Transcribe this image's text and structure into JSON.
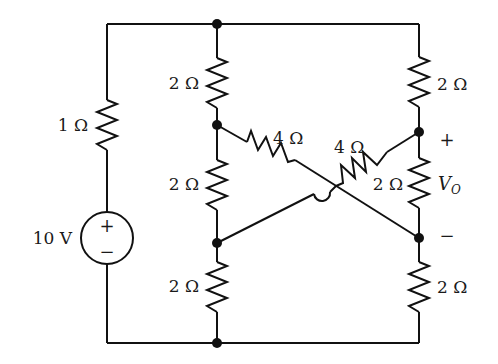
{
  "diagram": {
    "type": "circuit-schematic",
    "source": {
      "label": "10 V",
      "plus": "+",
      "minus": "−"
    },
    "resistors": {
      "r_left": {
        "label": "1 Ω"
      },
      "r_mid_top": {
        "label": "2 Ω"
      },
      "r_mid_middle": {
        "label": "2 Ω"
      },
      "r_mid_bottom": {
        "label": "2 Ω"
      },
      "r_right_top": {
        "label": "2 Ω"
      },
      "r_right_middle": {
        "label": "2 Ω"
      },
      "r_right_bottom": {
        "label": "2 Ω"
      },
      "r_cross_left": {
        "label": "4 Ω"
      },
      "r_cross_right": {
        "label": "4 Ω"
      }
    },
    "output": {
      "symbol": "V",
      "subscript": "O",
      "plus": "+",
      "minus": "−"
    }
  }
}
